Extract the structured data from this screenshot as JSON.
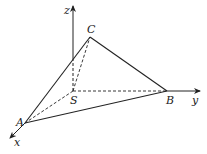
{
  "diagram": {
    "type": "3d-tetrahedron-coordinate-system",
    "points": {
      "S": {
        "label": "S",
        "x": 73,
        "y": 91
      },
      "A": {
        "label": "A",
        "x": 25,
        "y": 123
      },
      "B": {
        "label": "B",
        "x": 167,
        "y": 91
      },
      "C": {
        "label": "C",
        "x": 90,
        "y": 37
      }
    },
    "axes": {
      "x": {
        "label": "x"
      },
      "y": {
        "label": "y"
      },
      "z": {
        "label": "z"
      }
    },
    "solid_edges": [
      "AB",
      "BC",
      "CA"
    ],
    "dashed_edges": [
      "SA",
      "SB",
      "SC"
    ],
    "colors": {
      "stroke": "#222222",
      "background": "#ffffff"
    }
  }
}
